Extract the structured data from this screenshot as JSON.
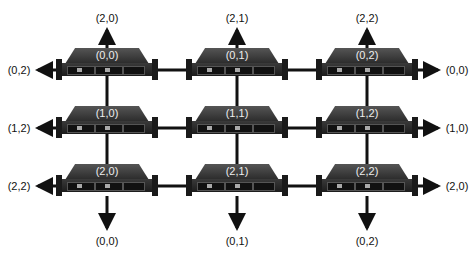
{
  "nodes": [
    {
      "id": "(0,0)",
      "row": 0,
      "col": 0
    },
    {
      "id": "(0,1)",
      "row": 0,
      "col": 1
    },
    {
      "id": "(0,2)",
      "row": 0,
      "col": 2
    },
    {
      "id": "(1,0)",
      "row": 1,
      "col": 0
    },
    {
      "id": "(1,1)",
      "row": 1,
      "col": 1
    },
    {
      "id": "(1,2)",
      "row": 1,
      "col": 2
    },
    {
      "id": "(2,0)",
      "row": 2,
      "col": 0
    },
    {
      "id": "(2,1)",
      "row": 2,
      "col": 1
    },
    {
      "id": "(2,2)",
      "row": 2,
      "col": 2
    }
  ],
  "wrap_labels": {
    "top": [
      "(2,0)",
      "(2,1)",
      "(2,2)"
    ],
    "bottom": [
      "(0,0)",
      "(0,1)",
      "(0,2)"
    ],
    "left": [
      "(0,2)",
      "(1,2)",
      "(2,2)"
    ],
    "right": [
      "(0,0)",
      "(1,0)",
      "(2,0)"
    ]
  },
  "colors": {
    "server_body": "#2a2a2a",
    "link": "#111111",
    "label": "#111111",
    "server_label": "#eeeeee"
  }
}
